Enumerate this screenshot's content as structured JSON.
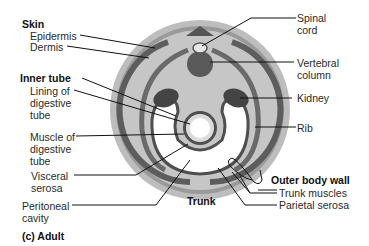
{
  "figure": {
    "panel_label": "(c) Adult",
    "center_label": "Trunk"
  },
  "labels_left": [
    {
      "text": "Skin",
      "bold": true
    },
    {
      "text": "Epidermis"
    },
    {
      "text": "Dermis"
    },
    {
      "text": "Inner tube",
      "bold": true
    },
    {
      "text": "Lining of"
    },
    {
      "text": "digestive"
    },
    {
      "text": "tube"
    },
    {
      "text": "Muscle of"
    },
    {
      "text": "digestive"
    },
    {
      "text": "tube"
    },
    {
      "text": "Visceral"
    },
    {
      "text": "serosa"
    },
    {
      "text": "Peritoneal"
    },
    {
      "text": "cavity"
    }
  ],
  "labels_right": [
    {
      "text": "Spinal"
    },
    {
      "text": "cord"
    },
    {
      "text": "Vertebral"
    },
    {
      "text": "column"
    },
    {
      "text": "Kidney"
    },
    {
      "text": "Rib"
    },
    {
      "text": "Outer body wall",
      "bold": true
    },
    {
      "text": "Trunk muscles"
    },
    {
      "text": "Parietal serosa"
    }
  ],
  "colors": {
    "outer_ring": "#b9b9b9",
    "dermis_ring": "#8a8a8a",
    "body_fill": "#c4c4c4",
    "muscle_dark": "#5a5a5a",
    "organ_dark": "#4a4a4a",
    "cavity": "#ffffff",
    "leader": "#111111"
  }
}
